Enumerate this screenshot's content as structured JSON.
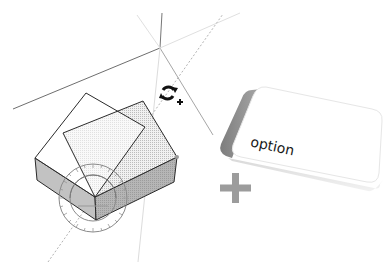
{
  "illustration": {
    "title": "Rotate tool with Option modifier",
    "tool_cursor": {
      "icon": "rotate-copy-cursor-icon",
      "modifier_glyph": "+"
    },
    "modifier": {
      "plus_glyph": "+",
      "key_label": "option"
    },
    "colors": {
      "axis_dark": "#6a6a6a",
      "axis_light": "#d6d6d6",
      "axis_dotted": "#b8b8b8",
      "face_side": "#bdbdbd",
      "face_top_dotted": "#e4e4e4",
      "edge": "#2a2a2a",
      "protractor": "#8a8a8a",
      "key_face": "#ffffff",
      "key_side": "#8e8e8e",
      "plus": "#9a9a9a"
    }
  }
}
